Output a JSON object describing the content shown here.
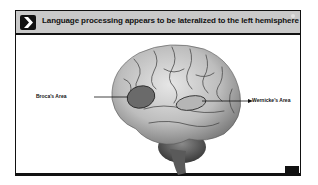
{
  "slide": {
    "title": "Language processing appears to be lateralized to the left hemisphere",
    "header_icon": "chevron-right-icon",
    "labels": {
      "broca": "Broca's Area",
      "wernicke": "Wernicke's Area"
    },
    "badge_text": "",
    "colors": {
      "header_bg": "#c9c9c9",
      "frame": "#111111",
      "broca_fill": "#6a6a6a",
      "wernicke_fill": "#b5b5b5"
    }
  }
}
